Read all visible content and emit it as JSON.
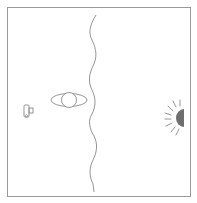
{
  "diagram": {
    "elements": [
      {
        "id": "device",
        "icon": "camera-icon",
        "position": "left"
      },
      {
        "id": "eye",
        "icon": "eye-icon",
        "position": "center-left"
      },
      {
        "id": "boundary",
        "icon": "wavy-line",
        "position": "center"
      },
      {
        "id": "sun",
        "icon": "sun-icon",
        "position": "right-edge"
      }
    ],
    "colors": {
      "stroke": "#8a8a8a",
      "frame": "#9a9a9a",
      "sun_fill": "#6e6e6e",
      "background": "#ffffff"
    }
  }
}
